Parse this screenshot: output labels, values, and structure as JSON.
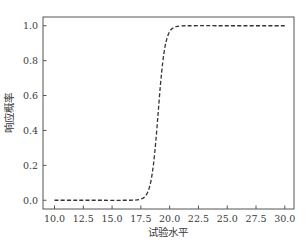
{
  "chart_data": {
    "type": "line",
    "title": "",
    "xlabel": "试验水平",
    "ylabel": "响应概率",
    "xlim": [
      9.0,
      30.8
    ],
    "ylim": [
      -0.05,
      1.05
    ],
    "xticks": [
      10.0,
      12.5,
      15.0,
      17.5,
      20.0,
      22.5,
      25.0,
      27.5,
      30.0
    ],
    "xtick_labels": [
      "10.0",
      "12.5",
      "15.0",
      "17.5",
      "20.0",
      "22.5",
      "25.0",
      "27.5",
      "30.0"
    ],
    "yticks": [
      0.0,
      0.2,
      0.4,
      0.6,
      0.8,
      1.0
    ],
    "ytick_labels": [
      "0.0",
      "0.2",
      "0.4",
      "0.6",
      "0.8",
      "1.0"
    ],
    "grid": false,
    "legend": null,
    "series": [
      {
        "name": "响应概率曲线",
        "style": "dashed",
        "color": "#333333",
        "x": [
          10.0,
          12.0,
          14.0,
          16.0,
          17.0,
          17.5,
          17.8,
          18.0,
          18.2,
          18.4,
          18.6,
          18.8,
          19.0,
          19.2,
          19.4,
          19.6,
          19.8,
          20.0,
          20.2,
          20.5,
          21.0,
          22.0,
          25.0,
          30.0
        ],
        "y": [
          0.0,
          0.0,
          0.0,
          0.0,
          0.001,
          0.007,
          0.018,
          0.034,
          0.065,
          0.119,
          0.209,
          0.339,
          0.5,
          0.661,
          0.791,
          0.881,
          0.935,
          0.966,
          0.982,
          0.993,
          0.999,
          1.0,
          1.0,
          1.0
        ]
      }
    ]
  },
  "colors": {
    "axis": "#555555",
    "line": "#333333",
    "background": "#ffffff"
  }
}
